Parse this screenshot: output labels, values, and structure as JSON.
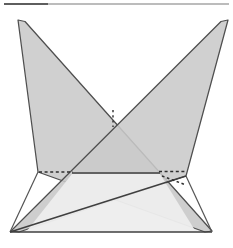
{
  "figure": {
    "width": 233,
    "height": 248,
    "background_color": "#ffffff",
    "stroke_color": "#4a4a4a",
    "stroke_color_dark": "#3a3a3a",
    "band_fill_color": "#c9c9c9",
    "band_fill_opacity": 0.85,
    "base_fill_color": "#e8e8e8",
    "base_top_fill_color": "#ffffff",
    "dash_color": "#333333",
    "stroke_width": 1.3,
    "caption": ""
  },
  "chart_data": {
    "type": "line",
    "xlabel": "",
    "ylabel": "",
    "xlim": [
      0,
      233
    ],
    "ylim": [
      248,
      0
    ],
    "grid": false,
    "legend": "none",
    "points": {
      "top_rule_left": [
        4,
        4
      ],
      "top_rule_right": [
        229,
        4
      ],
      "left_tip": [
        18,
        20
      ],
      "right_tip": [
        228,
        20
      ],
      "crossing_center": [
        113,
        118
      ],
      "left_wing": [
        38,
        172
      ],
      "right_wing": [
        186,
        176
      ],
      "base_bottom_left": [
        10,
        232
      ],
      "base_bottom_right": [
        212,
        232
      ],
      "base_top_left": [
        72,
        173
      ],
      "base_top_right": [
        160,
        173
      ],
      "dash_left_start": [
        40,
        172
      ],
      "dash_left_end": [
        72,
        172
      ],
      "dash_right_start": [
        160,
        172
      ],
      "dash_right_end": [
        184,
        172
      ],
      "dash_slant_start": [
        162,
        174
      ],
      "dash_slant_end": [
        184,
        184
      ],
      "center_tick_top": [
        113,
        110
      ],
      "center_tick_bottom": [
        113,
        127
      ]
    },
    "annotations": [
      {
        "name": "top-reference-rule",
        "kind": "solid-line",
        "from": [
          4,
          4
        ],
        "to": [
          229,
          4
        ]
      },
      {
        "name": "left-band",
        "kind": "shaded-quad",
        "vertices": [
          [
            18,
            20
          ],
          [
            24,
            22
          ],
          [
            212,
            232
          ],
          [
            196,
            232
          ],
          [
            38,
            172
          ]
        ]
      },
      {
        "name": "right-band",
        "kind": "shaded-quad",
        "vertices": [
          [
            228,
            20
          ],
          [
            222,
            22
          ],
          [
            10,
            232
          ],
          [
            26,
            232
          ],
          [
            186,
            176
          ]
        ]
      },
      {
        "name": "base-frustum",
        "kind": "shaded-trapezoid",
        "vertices": [
          [
            10,
            232
          ],
          [
            212,
            232
          ],
          [
            160,
            173
          ],
          [
            72,
            173
          ]
        ]
      },
      {
        "name": "hidden-edge-left",
        "kind": "dashed-line",
        "from": [
          40,
          172
        ],
        "to": [
          72,
          172
        ]
      },
      {
        "name": "hidden-edge-right",
        "kind": "dashed-line",
        "from": [
          160,
          172
        ],
        "to": [
          184,
          172
        ]
      },
      {
        "name": "hidden-edge-slant",
        "kind": "dashed-line",
        "from": [
          162,
          175
        ],
        "to": [
          186,
          185
        ]
      },
      {
        "name": "center-crossing-tick",
        "kind": "dashed-line",
        "from": [
          113,
          110
        ],
        "to": [
          113,
          127
        ]
      },
      {
        "name": "base-diagonal",
        "kind": "solid-line",
        "from": [
          10,
          232
        ],
        "to": [
          186,
          176
        ]
      },
      {
        "name": "base-top-edge",
        "kind": "solid-line",
        "from": [
          72,
          173
        ],
        "to": [
          160,
          173
        ]
      },
      {
        "name": "base-bottom-edge",
        "kind": "solid-line",
        "from": [
          10,
          232
        ],
        "to": [
          212,
          232
        ]
      }
    ]
  }
}
